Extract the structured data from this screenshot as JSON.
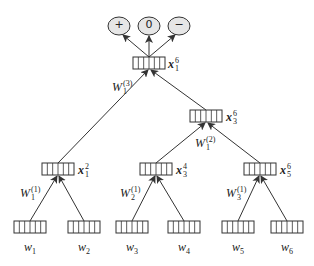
{
  "diagram": {
    "type": "recursive-neural-network-tree",
    "colors": {
      "stroke": "#333333",
      "circle_fill": "#e6e6e6",
      "box_fill": "#ffffff"
    },
    "outputs": [
      {
        "label": "+"
      },
      {
        "label": "0"
      },
      {
        "label": "−"
      }
    ],
    "root": {
      "base": "x",
      "sub": "1",
      "sup": "6"
    },
    "root_weight": {
      "base": "W",
      "sub": "1",
      "sup": "(3)"
    },
    "inner_right": {
      "base": "x",
      "sub": "3",
      "sup": "6"
    },
    "inner_right_weight": {
      "base": "W",
      "sub": "1",
      "sup": "(2)"
    },
    "mid_nodes": [
      {
        "base": "x",
        "sub": "1",
        "sup": "2"
      },
      {
        "base": "x",
        "sub": "3",
        "sup": "4"
      },
      {
        "base": "x",
        "sub": "5",
        "sup": "6"
      }
    ],
    "mid_weights": [
      {
        "base": "W",
        "sub": "1",
        "sup": "(1)"
      },
      {
        "base": "W",
        "sub": "2",
        "sup": "(1)"
      },
      {
        "base": "W",
        "sub": "3",
        "sup": "(1)"
      }
    ],
    "leaves": [
      {
        "base": "w",
        "sub": "1"
      },
      {
        "base": "w",
        "sub": "2"
      },
      {
        "base": "w",
        "sub": "3"
      },
      {
        "base": "w",
        "sub": "4"
      },
      {
        "base": "w",
        "sub": "5"
      },
      {
        "base": "w",
        "sub": "6"
      }
    ]
  }
}
